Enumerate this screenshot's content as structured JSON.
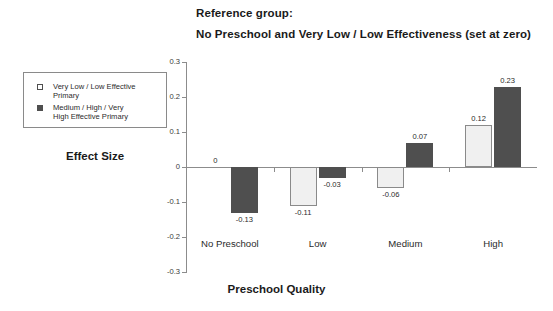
{
  "titles": {
    "reference_line": "Reference group:",
    "main_line": "No Preschool and Very Low / Low Effectiveness (set at zero)"
  },
  "legend": {
    "items": [
      {
        "marker": "open-square-icon",
        "label": "Very Low / Low Effective\nPrimary",
        "color": "#ffffff"
      },
      {
        "marker": "filled-square-icon",
        "label": "Medium / High / Very\nHigh Effective Primary",
        "color": "#4f4f4f"
      }
    ]
  },
  "axes": {
    "ylabel": "Effect Size",
    "xlabel": "Preschool Quality"
  },
  "chart_data": {
    "type": "bar",
    "title": "No Preschool and Very Low / Low Effectiveness (set at zero)",
    "subtitle": "Reference group:",
    "xlabel": "Preschool Quality",
    "ylabel": "Effect Size",
    "categories": [
      "No Preschool",
      "Low",
      "Medium",
      "High"
    ],
    "series": [
      {
        "name": "Very Low / Low Effective Primary",
        "values": [
          0,
          -0.11,
          -0.06,
          0.12
        ],
        "labels": [
          "0",
          "-0.11",
          "-0.06",
          "0.12"
        ],
        "color": "#f0f0f0"
      },
      {
        "name": "Medium / High / Very High Effective Primary",
        "values": [
          -0.13,
          -0.03,
          0.07,
          0.23
        ],
        "labels": [
          "-0.13",
          "-0.03",
          "0.07",
          "0.23"
        ],
        "color": "#4f4f4f"
      }
    ],
    "ylim": [
      -0.3,
      0.3
    ],
    "yticks": [
      0.3,
      0.2,
      0.1,
      0,
      -0.1,
      -0.2,
      -0.3
    ],
    "ytick_labels": [
      "0.3",
      "0.2",
      "0.1",
      "0",
      "-0.1",
      "-0.2",
      "-0.3"
    ],
    "grid": false,
    "legend_position": "upper-left-outside"
  }
}
